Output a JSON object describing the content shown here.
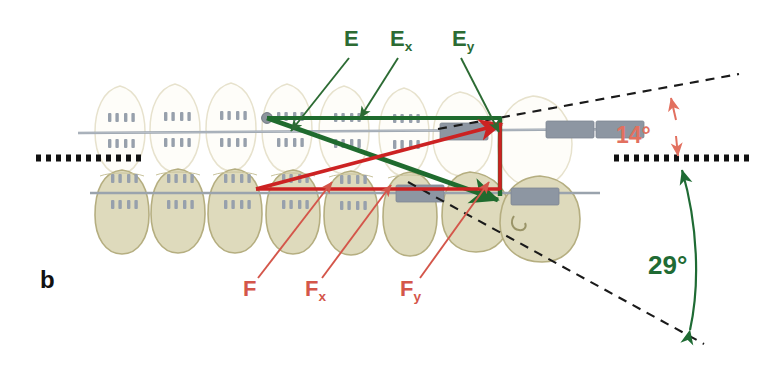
{
  "figure": {
    "panel_label": "b",
    "type": "orthodontic-force-vector-diagram",
    "background_color": "#ffffff"
  },
  "colors": {
    "green_vector": "#1f6b2e",
    "green_label": "#2c6b33",
    "green_angle": "#1f6b34",
    "red_vector": "#cc2222",
    "red_label": "#d4564a",
    "red_angle": "#e2705f",
    "archwire_gray": "#9aa3ad",
    "bracket_gray": "#8a93a0",
    "upper_tooth_fill": "#fefdf9",
    "upper_tooth_stroke": "#e8e4d2",
    "lower_tooth_fill": "#dedabc",
    "lower_tooth_stroke": "#b7b183",
    "dotted_line": "#111111",
    "dashed_line": "#1a1a1a"
  },
  "labels": {
    "green": [
      {
        "id": "E",
        "base": "E",
        "sub": "",
        "x": 344,
        "y": 48
      },
      {
        "id": "Ex",
        "base": "E",
        "sub": "x",
        "x": 390,
        "y": 48
      },
      {
        "id": "Ey",
        "base": "E",
        "sub": "y",
        "x": 452,
        "y": 48
      }
    ],
    "red": [
      {
        "id": "F",
        "base": "F",
        "sub": "",
        "x": 243,
        "y": 294
      },
      {
        "id": "Fx",
        "base": "F",
        "sub": "x",
        "x": 305,
        "y": 294
      },
      {
        "id": "Fy",
        "base": "F",
        "sub": "y",
        "x": 400,
        "y": 294
      }
    ]
  },
  "angles": [
    {
      "id": "angle-14",
      "value": "14°",
      "color": "#e2705f",
      "x": 617,
      "y": 143,
      "measures": "upper dashed reference line vs occlusal dotted plane"
    },
    {
      "id": "angle-29",
      "value": "29°",
      "color": "#1f6b34",
      "x": 652,
      "y": 268,
      "measures": "lower dashed reference line vs occlusal dotted plane"
    }
  ],
  "geometry": {
    "occlusal_plane_y": 158,
    "green_origin": {
      "x": 267,
      "y": 118
    },
    "green_corner": {
      "x": 500,
      "y": 118
    },
    "green_tip": {
      "x": 500,
      "y": 196
    },
    "red_origin": {
      "x": 256,
      "y": 188
    },
    "red_corner": {
      "x": 500,
      "y": 188
    },
    "red_tip": {
      "x": 500,
      "y": 124
    },
    "upper_dashed": {
      "x1": 440,
      "y1": 128,
      "x2": 737,
      "y2": 74
    },
    "lower_dashed": {
      "x1": 410,
      "y1": 185,
      "x2": 700,
      "y2": 343
    },
    "dotted_plane_left": {
      "x1": 36,
      "x2": 142,
      "y": 158
    },
    "dotted_plane_right": {
      "x1": 614,
      "x2": 752,
      "y": 158
    }
  },
  "arch": {
    "upper_teeth_count": 7,
    "lower_teeth_count": 7,
    "upper_archwire_y": 131,
    "lower_archwire_y": 192,
    "description": "Lateral view of maxillary (upper, pale) and mandibular (lower, olive) dental arches with bonded brackets and a continuous archwire."
  }
}
